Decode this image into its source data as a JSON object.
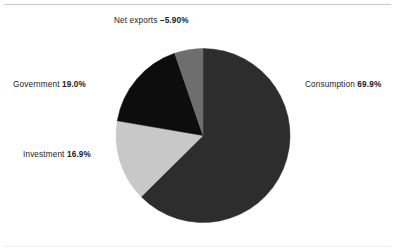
{
  "chart_data": {
    "type": "pie",
    "title": "",
    "subtitle": "",
    "xlabel": "",
    "ylabel": "",
    "legend_position": "callout-labels",
    "grid": false,
    "start_angle_deg": 0,
    "direction": "clockwise",
    "categories": [
      "Consumption",
      "Investment",
      "Government",
      "Net exports"
    ],
    "values": [
      69.9,
      16.9,
      19.0,
      -5.9
    ],
    "value_labels": [
      "69.9%",
      "16.9%",
      "19.0%",
      "–5.90%"
    ],
    "colors": [
      "#2d2d2d",
      "#c8c8c8",
      "#0d0d0d",
      "#6e6e6e"
    ],
    "slices": [
      {
        "name": "Consumption",
        "value": 69.9,
        "value_label": "69.9%",
        "color": "#2d2d2d",
        "label_text": "Consumption",
        "label_position": "right"
      },
      {
        "name": "Investment",
        "value": 16.9,
        "value_label": "16.9%",
        "color": "#c8c8c8",
        "label_text": "Investment",
        "label_position": "lower-left"
      },
      {
        "name": "Government",
        "value": 19.0,
        "value_label": "19.0%",
        "color": "#0d0d0d",
        "label_text": "Government",
        "label_position": "upper-left"
      },
      {
        "name": "Net exports",
        "value": -5.9,
        "value_label": "–5.90%",
        "color": "#6e6e6e",
        "label_text": "Net exports",
        "label_position": "top"
      }
    ]
  },
  "labels": {
    "net_exports": {
      "category": "Net exports",
      "value": "–5.90%"
    },
    "consumption": {
      "category": "Consumption",
      "value": "69.9%"
    },
    "government": {
      "category": "Government",
      "value": "19.0%"
    },
    "investment": {
      "category": "Investment",
      "value": "16.9%"
    }
  },
  "colors": {
    "consumption": "#2d2d2d",
    "investment": "#c8c8c8",
    "government": "#0d0d0d",
    "net_exports": "#6e6e6e",
    "background": "#ffffff",
    "rule": "#c9c9c9",
    "text": "#1c1c1c"
  }
}
